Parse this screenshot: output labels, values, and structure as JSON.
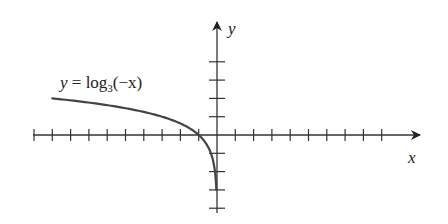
{
  "chart_data": {
    "type": "line",
    "title": "",
    "xlabel": "x",
    "ylabel": "y",
    "annotation": "y = log3(-x)",
    "annotation_parts": {
      "lhs": "y = log",
      "sub": "3",
      "rhs": "(−x)"
    },
    "xlim": [
      -10,
      11
    ],
    "ylim": [
      -4,
      6
    ],
    "grid": false,
    "x_ticks": [
      -10,
      -9,
      -8,
      -7,
      -6,
      -5,
      -4,
      -3,
      -2,
      -1,
      1,
      2,
      3,
      4,
      5,
      6,
      7,
      8,
      9
    ],
    "y_ticks": [
      -4,
      -3,
      -2,
      -1,
      1,
      2,
      3,
      4
    ],
    "series": [
      {
        "name": "y = log3(-x)",
        "function": "log3(-x)",
        "domain": [
          -9,
          -0.037
        ],
        "x": [
          -9,
          -7,
          -5,
          -3,
          -2,
          -1,
          -0.5,
          -0.25,
          -0.111,
          -0.037
        ],
        "values": [
          2,
          1.771,
          1.465,
          1,
          0.631,
          0,
          -0.631,
          -1.262,
          -2,
          -3
        ],
        "color": "#444444"
      }
    ]
  },
  "colors": {
    "axis": "#333333",
    "curve": "#4a4a4a"
  }
}
